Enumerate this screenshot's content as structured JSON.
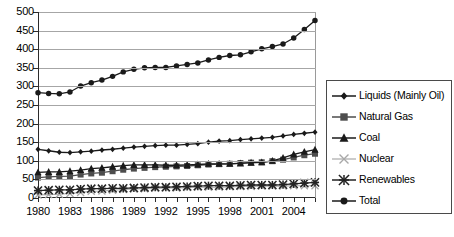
{
  "chart_data": {
    "type": "line",
    "title": "",
    "subtitle": "",
    "xlabel": "",
    "ylabel": "",
    "xlim": [
      1980,
      2006
    ],
    "ylim": [
      0,
      500
    ],
    "ytick_step": 50,
    "grid": true,
    "legend_position": "right",
    "x": [
      1980,
      1981,
      1982,
      1983,
      1984,
      1985,
      1986,
      1987,
      1988,
      1989,
      1990,
      1991,
      1992,
      1993,
      1994,
      1995,
      1996,
      1997,
      1998,
      1999,
      2000,
      2001,
      2002,
      2003,
      2004,
      2005,
      2006
    ],
    "xtick_labels": [
      "1980",
      "1983",
      "1986",
      "1989",
      "1992",
      "1995",
      "1998",
      "2001",
      "2004"
    ],
    "ytick_labels": [
      "0",
      "50",
      "100",
      "150",
      "200",
      "250",
      "300",
      "350",
      "400",
      "450",
      "500"
    ],
    "series": [
      {
        "name": "Liquids (Mainly Oil)",
        "marker": "diamond",
        "color": "#1a1a1a",
        "values": [
          131,
          127,
          123,
          122,
          124,
          126,
          129,
          131,
          134,
          137,
          139,
          141,
          142,
          142,
          144,
          146,
          150,
          153,
          154,
          157,
          159,
          161,
          163,
          167,
          171,
          174,
          177
        ]
      },
      {
        "name": "Natural Gas",
        "marker": "square",
        "color": "#4d4d4d",
        "values": [
          55,
          57,
          58,
          59,
          63,
          66,
          68,
          72,
          76,
          79,
          81,
          83,
          84,
          85,
          86,
          88,
          90,
          91,
          92,
          94,
          95,
          96,
          99,
          103,
          109,
          115,
          119
        ]
      },
      {
        "name": "Coal",
        "marker": "triangle",
        "color": "#1a1a1a",
        "values": [
          69,
          70,
          70,
          72,
          75,
          79,
          81,
          84,
          87,
          89,
          89,
          89,
          88,
          88,
          89,
          90,
          92,
          92,
          92,
          93,
          95,
          96,
          100,
          108,
          117,
          124,
          130
        ]
      },
      {
        "name": "Nuclear",
        "marker": "x-light",
        "color": "#a8a8a8",
        "values": [
          8,
          9,
          10,
          12,
          15,
          18,
          19,
          21,
          23,
          24,
          25,
          26,
          27,
          27,
          28,
          29,
          29,
          29,
          30,
          31,
          31,
          32,
          32,
          32,
          33,
          33,
          33
        ]
      },
      {
        "name": "Renewables",
        "marker": "star",
        "color": "#222222",
        "values": [
          20,
          21,
          22,
          22,
          24,
          25,
          25,
          26,
          26,
          27,
          28,
          29,
          29,
          30,
          31,
          32,
          33,
          33,
          33,
          34,
          35,
          35,
          35,
          36,
          38,
          40,
          42
        ]
      },
      {
        "name": "Total",
        "marker": "circle",
        "color": "#1a1a1a",
        "values": [
          283,
          281,
          280,
          285,
          301,
          310,
          317,
          327,
          339,
          346,
          350,
          351,
          351,
          355,
          359,
          363,
          371,
          378,
          383,
          385,
          393,
          401,
          407,
          414,
          430,
          453,
          477
        ]
      }
    ]
  },
  "legend": {
    "items": [
      {
        "label": "Liquids (Mainly Oil)"
      },
      {
        "label": "Natural Gas"
      },
      {
        "label": "Coal"
      },
      {
        "label": "Nuclear"
      },
      {
        "label": "Renewables"
      },
      {
        "label": "Total"
      }
    ]
  }
}
